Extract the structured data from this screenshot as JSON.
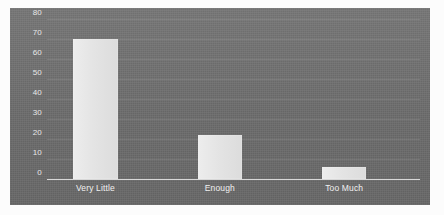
{
  "chart_data": {
    "type": "bar",
    "title": "",
    "subtitle": "",
    "xlabel": "",
    "ylabel": "",
    "categories": [
      "Very Little",
      "Enough",
      "Too Much"
    ],
    "values": [
      70,
      22,
      6
    ],
    "series": [
      {
        "name": "Responses",
        "values": [
          70,
          22,
          6
        ]
      }
    ],
    "ylim": [
      0,
      80
    ],
    "yticks": [
      0,
      10,
      20,
      30,
      40,
      50,
      60,
      70,
      80
    ],
    "ytick_labels": [
      "0",
      "10",
      "20",
      "30",
      "40",
      "50",
      "60",
      "70",
      "80"
    ],
    "grid": true,
    "grid_axis": "y",
    "legend": false,
    "legend_position": "none",
    "annotations": []
  },
  "style": {
    "panel_background": "#6d6d6d",
    "page_background": "#fcfcfc",
    "bar_color": "#e3e3e3",
    "axis_color": "#d8d8d8",
    "tick_text_color": "#e8e8e8",
    "category_text_color": "#f0f0f0",
    "gridline_color": "rgba(255,255,255,0.10)"
  }
}
